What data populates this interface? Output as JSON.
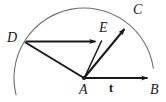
{
  "figure": {
    "background_color": "#ffffff",
    "stroke_color": "#1a1a1a",
    "arc_color": "#6e6e6e",
    "width": 166,
    "height": 102,
    "points": {
      "A": {
        "x": 84,
        "y": 78,
        "label": "A",
        "label_style": "italic"
      },
      "B": {
        "x": 153,
        "y": 78,
        "label": "B",
        "label_style": "italic"
      },
      "C": {
        "x": 128,
        "y": 24,
        "label": "C",
        "label_style": "italic"
      },
      "D": {
        "x": 25,
        "y": 42,
        "label": "D",
        "label_style": "italic"
      },
      "E": {
        "x": 101,
        "y": 41,
        "label": "E",
        "label_style": "italic"
      }
    },
    "labels": {
      "D": "D",
      "E": "E",
      "C": "C",
      "A": "A",
      "B": "B",
      "t": "t"
    },
    "arc": {
      "center_x": 84,
      "center_y": 78,
      "radius": 70,
      "start_angle_deg": 166,
      "end_angle_deg": 8
    },
    "vectors": [
      {
        "name": "AB",
        "from": "A",
        "to": "B",
        "arrowhead": true,
        "label": "t"
      },
      {
        "name": "AC",
        "from": "A",
        "to": "C",
        "arrowhead": true,
        "label": "C"
      },
      {
        "name": "DE",
        "from": "D",
        "to": "E",
        "arrowhead": true,
        "label": "E"
      }
    ],
    "segments": [
      {
        "name": "DA",
        "from": "D",
        "to": "A",
        "arrowhead": false
      },
      {
        "name": "EA",
        "from": "E",
        "to": "A",
        "arrowhead": false
      }
    ]
  }
}
